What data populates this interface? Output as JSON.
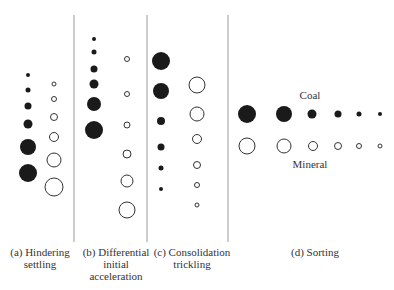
{
  "panels": [
    {
      "id": "a",
      "caption_line1": "(a) Hindering",
      "caption_line2": "settling",
      "caption_line3": ""
    },
    {
      "id": "b",
      "caption_line1": "(b) Differential",
      "caption_line2": "initial",
      "caption_line3": "acceleration"
    },
    {
      "id": "c",
      "caption_line1": "(c) Consolidation",
      "caption_line2": "trickling",
      "caption_line3": ""
    },
    {
      "id": "d",
      "caption_line1": "(d) Sorting",
      "caption_line2": "",
      "caption_line3": ""
    }
  ],
  "sorting_labels": {
    "coal": "Coal",
    "mineral": "Mineral"
  },
  "legend_semantics": {
    "filled_circle": "Coal",
    "open_circle": "Mineral"
  },
  "colors": {
    "coal": "#1a1a1a",
    "mineral_stroke": "#333333",
    "divider": "#999999"
  }
}
